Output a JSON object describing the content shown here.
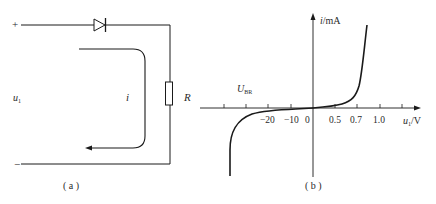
{
  "figure_a": {
    "caption": "( a )",
    "plus_terminal": "+",
    "minus_terminal": "−",
    "source_label": "u",
    "source_subscript": "1",
    "current_label": "i",
    "resistor_label": "R",
    "components": [
      "diode",
      "resistor"
    ]
  },
  "figure_b": {
    "caption": "( b )",
    "y_axis_label": "i",
    "y_axis_unit": "/mA",
    "x_axis_label": "u",
    "x_axis_subscript": "1",
    "x_axis_unit": "/V",
    "breakdown_label": "U",
    "breakdown_subscript": "BR",
    "x_ticks": [
      "−20",
      "−10",
      "0",
      "0.5",
      "0.7",
      "1.0"
    ]
  },
  "colors": {
    "line": "#1a1a1a",
    "text": "#2a2a2a",
    "background": "#ffffff"
  }
}
